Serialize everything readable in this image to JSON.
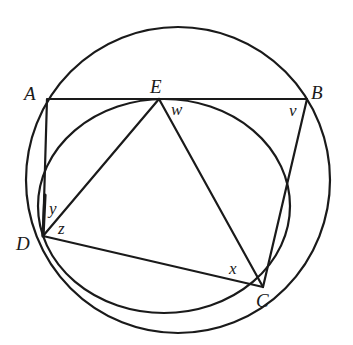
{
  "figure": {
    "type": "geometry",
    "points": {
      "A": {
        "label": "A",
        "x": 48,
        "y": 99
      },
      "B": {
        "label": "B",
        "x": 307,
        "y": 99
      },
      "E": {
        "label": "E",
        "x": 159,
        "y": 99
      },
      "D": {
        "label": "D",
        "x": 43,
        "y": 236
      },
      "C": {
        "label": "C",
        "x": 263,
        "y": 287
      }
    },
    "angle_labels": {
      "w": {
        "label": "w",
        "at": "E"
      },
      "v": {
        "label": "v",
        "at": "B"
      },
      "y": {
        "label": "y",
        "at": "D"
      },
      "z": {
        "label": "z",
        "at": "D"
      },
      "x": {
        "label": "x",
        "at": "C"
      }
    },
    "segments": [
      "AB",
      "AD",
      "DE",
      "EC",
      "DC",
      "BC"
    ],
    "circles": [
      {
        "name": "large-circle",
        "through": [
          "A",
          "B",
          "C",
          "D"
        ]
      },
      {
        "name": "small-circle",
        "tangent_at": "E",
        "through": [
          "D",
          "C"
        ]
      }
    ],
    "stroke_color": "#1a1a1a",
    "background": "#ffffff"
  }
}
